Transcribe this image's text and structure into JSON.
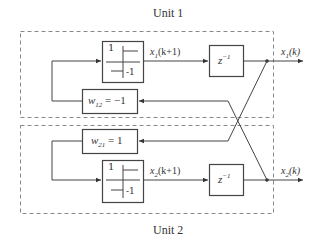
{
  "diagram": {
    "type": "block-diagram",
    "units": [
      {
        "label": "Unit 1",
        "nonlinearity": {
          "top_value": "1",
          "bottom_value": "-1"
        },
        "signal_next": {
          "var": "x",
          "sub": "1",
          "arg": "(k+1)"
        },
        "delay": {
          "base": "z",
          "exp": "−1"
        },
        "output": {
          "var": "x",
          "sub": "1",
          "arg": "(k)"
        },
        "weight": {
          "var": "w",
          "sub": "12",
          "value": " = −1"
        }
      },
      {
        "label": "Unit 2",
        "nonlinearity": {
          "top_value": "1",
          "bottom_value": "-1"
        },
        "signal_next": {
          "var": "x",
          "sub": "2",
          "arg": "(k+1)"
        },
        "delay": {
          "base": "z",
          "exp": "−1"
        },
        "output": {
          "var": "x",
          "sub": "2",
          "arg": "(k)"
        },
        "weight": {
          "var": "w",
          "sub": "21",
          "value": " = 1"
        }
      }
    ],
    "connections": [
      "x1(k) feeds weight w21 in Unit 2",
      "x2(k) feeds weight w12 in Unit 1",
      "w12 output feeds sign block of Unit 1",
      "w21 output feeds sign block of Unit 2"
    ],
    "colors": {
      "line": "#444444",
      "dashed": "#777777"
    }
  }
}
